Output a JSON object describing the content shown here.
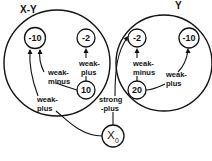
{
  "groups": [
    {
      "id": "xy",
      "label": "X-Y"
    },
    {
      "id": "y",
      "label": "Y"
    }
  ],
  "nodes": [
    {
      "id": "xy_m10",
      "group": "xy",
      "label": "-10"
    },
    {
      "id": "xy_m2",
      "group": "xy",
      "label": "-2"
    },
    {
      "id": "xy_10",
      "group": "xy",
      "label": "10"
    },
    {
      "id": "y_m2",
      "group": "y",
      "label": "-2"
    },
    {
      "id": "y_m10",
      "group": "y",
      "label": "-10"
    },
    {
      "id": "y_20",
      "group": "y",
      "label": "20"
    },
    {
      "id": "x0",
      "group": null,
      "label": "X",
      "subscript": "0"
    }
  ],
  "edges": [
    {
      "from": "xy_10",
      "to": "xy_m10",
      "label_lines": [
        "weak-",
        "minus"
      ]
    },
    {
      "from": "xy_10",
      "to": "xy_m2",
      "label_lines": [
        "weak-",
        "plus"
      ]
    },
    {
      "from": "x0",
      "to": "xy_m10",
      "label_lines": [
        "weak-",
        "plus"
      ]
    },
    {
      "from": "x0",
      "to": "y_m2",
      "label_lines": [
        "strong",
        "-plus"
      ]
    },
    {
      "from": "y_20",
      "to": "y_m2",
      "label_lines": [
        "weak-",
        "minus"
      ]
    },
    {
      "from": "y_20",
      "to": "y_m10",
      "label_lines": [
        "weak-",
        "plus"
      ]
    }
  ]
}
